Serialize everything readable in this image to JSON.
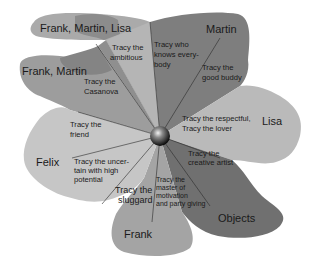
{
  "diagram": {
    "center": {
      "label": "",
      "shape": "sphere"
    },
    "groups": [
      {
        "id": "frank-martin-lisa",
        "label": "Frank, Martin, Lisa",
        "color": "#a9a9a9"
      },
      {
        "id": "frank-martin",
        "label": "Frank, Martin",
        "color": "#9a9a9a"
      },
      {
        "id": "martin",
        "label": "Martin",
        "color": "#7d7d7d"
      },
      {
        "id": "lisa",
        "label": "Lisa",
        "color": "#b8b8b8"
      },
      {
        "id": "felix",
        "label": "Felix",
        "color": "#c4c4c4"
      },
      {
        "id": "frank",
        "label": "Frank",
        "color": "#a2a2a2"
      },
      {
        "id": "objects",
        "label": "Objects",
        "color": "#6e6e6e"
      }
    ],
    "roles": [
      {
        "line1": "Tracy the",
        "line2": "ambitious",
        "line3": ""
      },
      {
        "line1": "Tracy the",
        "line2": "Casanova",
        "line3": ""
      },
      {
        "line1": "Tracy the",
        "line2": "friend",
        "line3": ""
      },
      {
        "line1": "Tracy the uncer-",
        "line2": "tain with high",
        "line3": "potential"
      },
      {
        "line1": "Tracy the",
        "line2": "sluggard",
        "line3": ""
      },
      {
        "line1": "Tracy the",
        "line2": "master of",
        "line3": "motivation",
        "line4": "and party giving"
      },
      {
        "line1": "Tracy the",
        "line2": "creative artist",
        "line3": ""
      },
      {
        "line1": "Tracy the respectful,",
        "line2": "Tracy the lover",
        "line3": ""
      },
      {
        "line1": "Tracy the",
        "line2": "good buddy",
        "line3": ""
      },
      {
        "line1": "Tracy who",
        "line2": "knows every-",
        "line3": "body"
      }
    ]
  }
}
